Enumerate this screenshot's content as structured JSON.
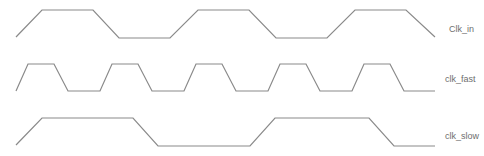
{
  "diagram": {
    "type": "timing-diagram",
    "signals": [
      {
        "name": "Clk_in",
        "high_level_y": 10,
        "low_level_y": 38,
        "points": "16,37 42,10 93,10 119,38 170,38 198,10 249,10 276,38 327,38 355,10 406,10 435,37"
      },
      {
        "name": "clk_fast",
        "high_level_y": 64,
        "low_level_y": 91,
        "points": "16,91 28,64 54,64 68,91 100,91 112,64 138,64 152,91 184,91 196,64 222,64 236,91 268,91 280,64 306,64 320,91 352,91 364,64 390,64 404,91 435,91"
      },
      {
        "name": "clk_slow",
        "high_level_y": 118,
        "low_level_y": 146,
        "points": "16,145 42,118 133,118 158,146 250,146 275,118 369,118 394,146 435,146"
      }
    ],
    "colors": {
      "waveform": "#8a8a8a",
      "label": "#6e6e6e",
      "background": "#ffffff"
    }
  }
}
